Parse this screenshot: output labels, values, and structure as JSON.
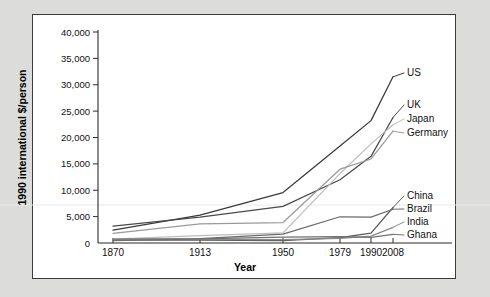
{
  "chart_data": {
    "type": "line",
    "title": "",
    "xlabel": "Year",
    "ylabel": "1990 international $/person",
    "x": [
      1870,
      1913,
      1950,
      1979,
      1990,
      2008
    ],
    "xtick_labels": [
      "1870",
      "1913",
      "1950",
      "1979",
      "1990",
      "2008"
    ],
    "ytick_labels": [
      "0",
      "5,000",
      "10,000",
      "15,000",
      "20,000",
      "25,000",
      "30,000",
      "35,000",
      "40,000"
    ],
    "ytick_values": [
      0,
      5000,
      10000,
      15000,
      20000,
      25000,
      30000,
      35000,
      40000
    ],
    "ylim": [
      0,
      40000
    ],
    "grid": false,
    "legend_position": "right-inline",
    "series": [
      {
        "name": "US",
        "label": "US",
        "color": "#3a3a3a",
        "values": [
          2445,
          5301,
          9561,
          18390,
          23201,
          31500
        ]
      },
      {
        "name": "UK",
        "label": "UK",
        "color": "#4a4a4a",
        "values": [
          3190,
          4921,
          6939,
          12000,
          16430,
          23800
        ]
      },
      {
        "name": "Japan",
        "label": "Japan",
        "color": "#bdbdbd",
        "values": [
          737,
          1387,
          1921,
          13163,
          18789,
          22400
        ]
      },
      {
        "name": "Germany",
        "label": "Germany",
        "color": "#9a9a9a",
        "values": [
          1839,
          3648,
          3881,
          13993,
          15929,
          21200
        ]
      },
      {
        "name": "China",
        "label": "China",
        "color": "#5a5a5a",
        "values": [
          530,
          552,
          448,
          1039,
          1871,
          6725
        ]
      },
      {
        "name": "Brazil",
        "label": "Brazil",
        "color": "#6a6a6a",
        "values": [
          713,
          811,
          1672,
          4974,
          4920,
          6400
        ]
      },
      {
        "name": "India",
        "label": "India",
        "color": "#8a8a8a",
        "values": [
          533,
          673,
          619,
          895,
          1309,
          2975
        ]
      },
      {
        "name": "Ghana",
        "label": "Ghana",
        "color": "#707070",
        "values": [
          439,
          781,
          1122,
          1189,
          1063,
          1650
        ]
      }
    ]
  }
}
